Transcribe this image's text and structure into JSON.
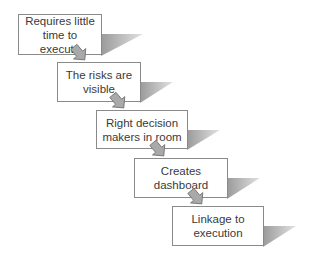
{
  "diagram": {
    "type": "staircase-flow",
    "colors": {
      "box_border": "#8a8a8a",
      "box_fill": "#ffffff",
      "text": "#3a3a3a",
      "shadow": "#b0b0b0",
      "arrow_fill": "#a9a9a9",
      "arrow_stroke": "#6f6f6f"
    },
    "steps": [
      {
        "label": "Requires little time to execute",
        "line1": "Requires little",
        "line2": "time to execute"
      },
      {
        "label": "The risks are visible",
        "line1": "The risks are",
        "line2": "visible"
      },
      {
        "label": "Right decision makers in room",
        "line1": "Right decision",
        "line2": "makers in room"
      },
      {
        "label": "Creates dashboard",
        "line1": "Creates",
        "line2": "dashboard"
      },
      {
        "label": "Linkage to execution",
        "line1": "Linkage to",
        "line2": "execution"
      }
    ],
    "connector_icon": "down-right-block-arrow"
  }
}
